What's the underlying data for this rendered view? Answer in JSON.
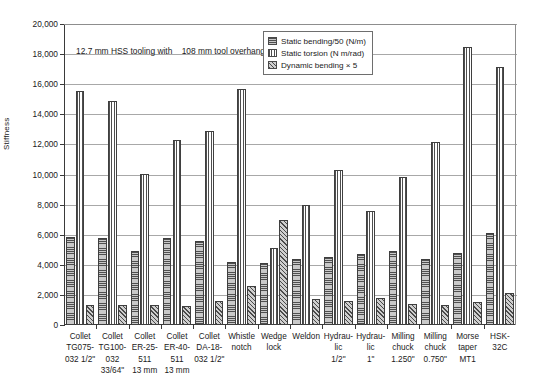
{
  "chart_data": {
    "type": "bar",
    "title": "",
    "xlabel": "",
    "ylabel": "Stiffness",
    "ylim": [
      0,
      20000
    ],
    "ytick_step": 2000,
    "ytick_labels": [
      "20,000",
      "18,000",
      "16,000",
      "14,000",
      "12,000",
      "10,000",
      "8,000",
      "6,000",
      "4,000",
      "2,000",
      "0"
    ],
    "grid": true,
    "legend_position": "top-center",
    "annotation": {
      "line1": "12.7 mm HSS tooling with",
      "line2": "108 mm tool overhang"
    },
    "categories": [
      [
        "Collet",
        "TG075-",
        "032 1/2\""
      ],
      [
        "Collet",
        "TG100-",
        "032",
        "33/64\""
      ],
      [
        "Collet",
        "ER-25-",
        "511",
        "13 mm"
      ],
      [
        "Collet",
        "ER-40-",
        "511",
        "13 mm"
      ],
      [
        "Collet",
        "DA-18-",
        "032 1/2\""
      ],
      [
        "Whistle",
        "notch"
      ],
      [
        "Wedge",
        "lock"
      ],
      [
        "Weldon"
      ],
      [
        "Hydrau-",
        "lic",
        "1/2\""
      ],
      [
        "Hydrau-",
        "lic",
        "1\""
      ],
      [
        "Milling",
        "chuck",
        "1.250\""
      ],
      [
        "Milling",
        "chuck",
        "0.750\""
      ],
      [
        "Morse",
        "taper",
        "MT1"
      ],
      [
        "HSK-",
        "32C"
      ]
    ],
    "series": [
      {
        "name": "Static bending/50 (N/m)",
        "pattern": "horizontal-lines",
        "values": [
          5880,
          5800,
          4950,
          5780,
          5560,
          4160,
          4140,
          4360,
          4510,
          4700,
          4900,
          4380,
          4790,
          6090
        ]
      },
      {
        "name": "Static torsion (N m/rad)",
        "pattern": "vertical-lines",
        "values": [
          15570,
          14870,
          10050,
          12320,
          12910,
          15650,
          5150,
          7980,
          10300,
          7570,
          9860,
          12170,
          18450,
          17160
        ]
      },
      {
        "name": "Dynamic bending × 5",
        "pattern": "diagonal-hatch",
        "values": [
          1360,
          1340,
          1340,
          1270,
          1620,
          2620,
          6950,
          1720,
          1600,
          1790,
          1410,
          1320,
          1540,
          2160
        ]
      }
    ]
  }
}
